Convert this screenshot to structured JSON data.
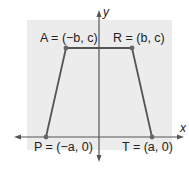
{
  "diagram": {
    "type": "coordinate-plane-trapezoid",
    "axes": {
      "x_label": "x",
      "y_label": "y"
    },
    "vertices": [
      {
        "name": "A",
        "label": "A = (−b, c)"
      },
      {
        "name": "R",
        "label": "R = (b, c)"
      },
      {
        "name": "P",
        "label": "P = (−a, 0)"
      },
      {
        "name": "T",
        "label": "T = (a, 0)"
      }
    ],
    "colors": {
      "panel": "#ececec",
      "lines": "#555555",
      "points": "#666666"
    }
  }
}
